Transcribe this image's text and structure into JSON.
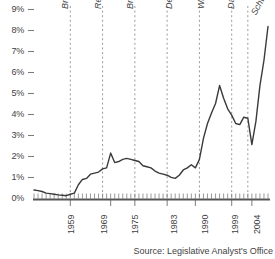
{
  "chart_data": {
    "type": "line",
    "title": "",
    "subtitle": "",
    "xlabel": "",
    "ylabel": "",
    "ylim": [
      0,
      9
    ],
    "xlim": [
      1950,
      2008
    ],
    "grid": false,
    "legend": "none",
    "y_ticks": [
      "0%",
      "1%",
      "2%",
      "3%",
      "4%",
      "5%",
      "6%",
      "7%",
      "8%",
      "9%"
    ],
    "y_tick_values": [
      0,
      1,
      2,
      3,
      4,
      5,
      6,
      7,
      8,
      9
    ],
    "x_ticks": [
      "1959",
      "1969",
      "1975",
      "1983",
      "1990",
      "1999",
      "2004"
    ],
    "x_tick_values": [
      1959,
      1969,
      1975,
      1983,
      1990,
      1999,
      2004
    ],
    "annotations": [
      {
        "label": "Brown",
        "x": 1959
      },
      {
        "label": "Reagan",
        "x": 1967
      },
      {
        "label": "Reagan",
        "x": 1969
      },
      {
        "label": "Brown",
        "x": 1975
      },
      {
        "label": "Deukmejian",
        "x": 1983
      },
      {
        "label": "Wilson",
        "x": 1991
      },
      {
        "label": "Davis",
        "x": 1999
      },
      {
        "label": "Schwarzenegger",
        "x": 2003
      }
    ],
    "governor_markers": [
      {
        "label": "Brown",
        "year": 1959
      },
      {
        "label": "Reagan",
        "year": 1967
      },
      {
        "label": "Brown",
        "year": 1975
      },
      {
        "label": "Deukmejian",
        "year": 1983
      },
      {
        "label": "Wilson",
        "year": 1991
      },
      {
        "label": "Davis",
        "year": 1999
      },
      {
        "label": "Schwarzenegger",
        "year": 2003
      }
    ],
    "x": [
      1950,
      1951,
      1952,
      1953,
      1954,
      1955,
      1956,
      1957,
      1958,
      1959,
      1960,
      1961,
      1962,
      1963,
      1964,
      1965,
      1966,
      1967,
      1968,
      1969,
      1970,
      1971,
      1972,
      1973,
      1974,
      1975,
      1976,
      1977,
      1978,
      1979,
      1980,
      1981,
      1982,
      1983,
      1984,
      1985,
      1986,
      1987,
      1988,
      1989,
      1990,
      1991,
      1992,
      1993,
      1994,
      1995,
      1996,
      1997,
      1998,
      1999,
      2000,
      2001,
      2002,
      2003,
      2004,
      2005,
      2006,
      2007,
      2008
    ],
    "values": [
      0.45,
      0.42,
      0.38,
      0.3,
      0.28,
      0.25,
      0.22,
      0.2,
      0.18,
      0.25,
      0.3,
      0.7,
      0.95,
      1.0,
      1.2,
      1.25,
      1.3,
      1.45,
      1.5,
      2.2,
      1.75,
      1.8,
      1.9,
      1.95,
      1.9,
      1.85,
      1.8,
      1.6,
      1.55,
      1.5,
      1.35,
      1.25,
      1.2,
      1.15,
      1.05,
      1.0,
      1.15,
      1.4,
      1.5,
      1.65,
      1.5,
      1.9,
      2.9,
      3.6,
      4.1,
      4.55,
      5.4,
      4.8,
      4.3,
      4.0,
      3.6,
      3.55,
      3.9,
      3.85,
      2.6,
      3.7,
      5.4,
      6.6,
      8.2
    ],
    "series_name": "Debt Service as Percent of General Fund",
    "line_color": "#3a3a3a"
  },
  "axis": {
    "y_labels": [
      "9%",
      "8%",
      "7%",
      "6%",
      "5%",
      "4%",
      "3%",
      "2%",
      "1%",
      "0%"
    ],
    "x_labels": [
      "1959",
      "1969",
      "1975",
      "1983",
      "1990",
      "1999",
      "2004"
    ]
  },
  "governors": [
    "Brown",
    "Reagan",
    "Brown",
    "Deukmejian",
    "Wilson",
    "Davis",
    "Schwarzenegger"
  ],
  "footer": {
    "source": "Source: Legislative Analyst's Office"
  },
  "colors": {
    "line": "#3a3a3a",
    "axis": "#555555",
    "dashed": "#9a9a9a",
    "text": "#3f3f3f",
    "background": "#ffffff"
  }
}
